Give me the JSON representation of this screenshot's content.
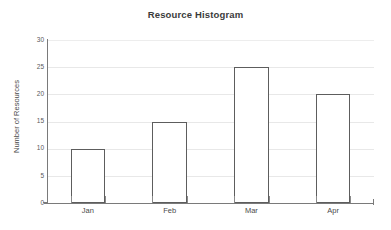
{
  "chart_data": {
    "type": "bar",
    "title": "Resource Histogram",
    "xlabel": "",
    "ylabel": "Number of Resources",
    "categories": [
      "Jan",
      "Feb",
      "Mar",
      "Apr"
    ],
    "values": [
      10,
      15,
      25,
      20
    ],
    "series": [
      {
        "name": "Number of Resources",
        "values": [
          10,
          15,
          25,
          20
        ]
      }
    ],
    "ylim": [
      0,
      30
    ],
    "yticks": [
      0,
      5,
      10,
      15,
      20,
      25,
      30
    ],
    "ytick_labels": [
      "0",
      "5",
      "10",
      "15",
      "20",
      "25",
      "30"
    ],
    "grid": true,
    "grid_axis": "y",
    "legend": false,
    "legend_position": "none",
    "bar_fill_color": "#ffffff",
    "bar_edge_color": "#5d5d5d",
    "gridline_color": "#e8e8e8",
    "axis_color": "#7a7a7a",
    "title_color": "#3b3b3b",
    "background_color": "#ffffff"
  }
}
